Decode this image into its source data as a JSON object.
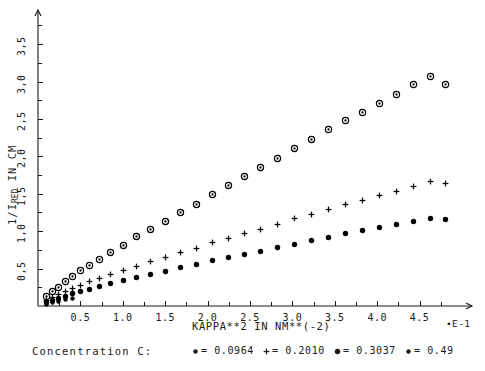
{
  "chart_data": {
    "type": "scatter",
    "title": "",
    "xlabel": "KAPPA**2 IN NM**(-2)",
    "ylabel": "1/I_RED IN CM",
    "ylabel_prefix": "1/I",
    "ylabel_sub": "RED",
    "ylabel_suffix": " IN CM",
    "x_exponent_note": "•E-1",
    "xlim": [
      0.0,
      5.0
    ],
    "ylim": [
      0.0,
      3.85
    ],
    "x_ticks": [
      0.5,
      1.0,
      1.5,
      2.0,
      2.5,
      3.0,
      3.5,
      4.0,
      4.5
    ],
    "x_tick_labels": [
      "0.5",
      "1.0",
      "1.5",
      "2.0",
      "2.5",
      "3.0",
      "3.5",
      "4.0",
      "4.5"
    ],
    "y_ticks": [
      0.5,
      1.0,
      1.5,
      2.0,
      2.5,
      3.0,
      3.5
    ],
    "y_tick_labels": [
      "0,5",
      "1,0",
      "1,5",
      "2,0",
      "2,5",
      "3,0",
      "3,5"
    ],
    "x_minor_step": 0.25,
    "y_minor_step": 0.25,
    "grid": false,
    "legend_position": "below-axis",
    "axis_arrows": true,
    "series": [
      {
        "name": "0.0964",
        "marker": "circle-dot",
        "color": "#000000",
        "points": [
          [
            0.1,
            0.13
          ],
          [
            0.17,
            0.2
          ],
          [
            0.24,
            0.26
          ],
          [
            0.32,
            0.33
          ],
          [
            0.4,
            0.4
          ],
          [
            0.5,
            0.48
          ],
          [
            0.6,
            0.55
          ],
          [
            0.72,
            0.63
          ],
          [
            0.85,
            0.72
          ],
          [
            1.0,
            0.82
          ],
          [
            1.15,
            0.93
          ],
          [
            1.32,
            1.03
          ],
          [
            1.5,
            1.14
          ],
          [
            1.68,
            1.25
          ],
          [
            1.86,
            1.37
          ],
          [
            2.05,
            1.5
          ],
          [
            2.24,
            1.62
          ],
          [
            2.43,
            1.74
          ],
          [
            2.62,
            1.86
          ],
          [
            2.82,
            1.98
          ],
          [
            3.02,
            2.11
          ],
          [
            3.22,
            2.23
          ],
          [
            3.42,
            2.36
          ],
          [
            3.62,
            2.48
          ],
          [
            3.82,
            2.6
          ],
          [
            4.02,
            2.72
          ],
          [
            4.22,
            2.84
          ],
          [
            4.42,
            2.97
          ],
          [
            4.62,
            3.07
          ],
          [
            4.8,
            2.97
          ]
        ]
      },
      {
        "name": "0.2010",
        "marker": "plus",
        "color": "#000000",
        "points": [
          [
            0.1,
            0.08
          ],
          [
            0.17,
            0.12
          ],
          [
            0.24,
            0.16
          ],
          [
            0.32,
            0.2
          ],
          [
            0.4,
            0.24
          ],
          [
            0.5,
            0.28
          ],
          [
            0.6,
            0.33
          ],
          [
            0.72,
            0.38
          ],
          [
            0.85,
            0.43
          ],
          [
            1.0,
            0.48
          ],
          [
            1.15,
            0.54
          ],
          [
            1.32,
            0.6
          ],
          [
            1.5,
            0.66
          ],
          [
            1.68,
            0.72
          ],
          [
            1.86,
            0.78
          ],
          [
            2.05,
            0.85
          ],
          [
            2.24,
            0.91
          ],
          [
            2.43,
            0.97
          ],
          [
            2.62,
            1.03
          ],
          [
            2.82,
            1.1
          ],
          [
            3.02,
            1.17
          ],
          [
            3.22,
            1.23
          ],
          [
            3.42,
            1.3
          ],
          [
            3.62,
            1.36
          ],
          [
            3.82,
            1.42
          ],
          [
            4.02,
            1.48
          ],
          [
            4.22,
            1.54
          ],
          [
            4.42,
            1.6
          ],
          [
            4.62,
            1.67
          ],
          [
            4.8,
            1.64
          ]
        ]
      },
      {
        "name": "0.3037",
        "marker": "dot",
        "color": "#000000",
        "points": [
          [
            0.1,
            0.05
          ],
          [
            0.17,
            0.08
          ],
          [
            0.24,
            0.11
          ],
          [
            0.32,
            0.14
          ],
          [
            0.4,
            0.17
          ],
          [
            0.5,
            0.2
          ],
          [
            0.6,
            0.23
          ],
          [
            0.72,
            0.27
          ],
          [
            0.85,
            0.31
          ],
          [
            1.0,
            0.35
          ],
          [
            1.15,
            0.39
          ],
          [
            1.32,
            0.43
          ],
          [
            1.5,
            0.47
          ],
          [
            1.68,
            0.52
          ],
          [
            1.86,
            0.56
          ],
          [
            2.05,
            0.61
          ],
          [
            2.24,
            0.65
          ],
          [
            2.43,
            0.7
          ],
          [
            2.62,
            0.74
          ],
          [
            2.82,
            0.79
          ],
          [
            3.02,
            0.83
          ],
          [
            3.22,
            0.88
          ],
          [
            3.42,
            0.92
          ],
          [
            3.62,
            0.97
          ],
          [
            3.82,
            1.01
          ],
          [
            4.02,
            1.05
          ],
          [
            4.22,
            1.09
          ],
          [
            4.42,
            1.13
          ],
          [
            4.62,
            1.18
          ],
          [
            4.8,
            1.16
          ]
        ]
      },
      {
        "name": "0.49",
        "marker": "dot-small",
        "color": "#000000",
        "points": [
          [
            0.1,
            0.03
          ],
          [
            0.17,
            0.05
          ],
          [
            0.24,
            0.07
          ],
          [
            0.32,
            0.09
          ],
          [
            0.4,
            0.11
          ]
        ]
      }
    ]
  },
  "axis": {
    "ylabel_text": "1/IRED IN CM",
    "xlabel_text": "KAPPA**2 IN NM**(-2)",
    "exp_note": "•E-1"
  },
  "legend": {
    "title": "Concentration C:",
    "entries": [
      {
        "marker_glyph": "·",
        "marker_kind": "circle-dot",
        "text": "= 0.0964"
      },
      {
        "marker_glyph": "·",
        "marker_kind": "plus",
        "text": "= 0.2010"
      },
      {
        "marker_glyph": "•",
        "marker_kind": "dot",
        "text": "= 0.3037"
      },
      {
        "marker_glyph": "•",
        "marker_kind": "dot-small",
        "text": "= 0.49"
      }
    ]
  }
}
